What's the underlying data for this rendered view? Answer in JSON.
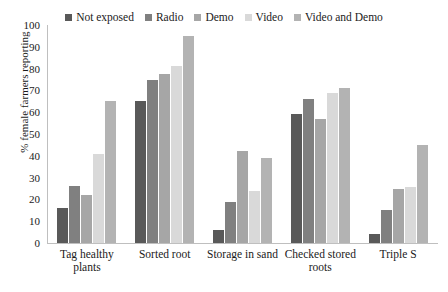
{
  "chart_data": {
    "type": "bar",
    "title": "",
    "xlabel": "",
    "ylabel": "% female farmers reporting",
    "ylim": [
      0,
      100
    ],
    "yticks": [
      0,
      10,
      20,
      30,
      40,
      50,
      60,
      70,
      80,
      90,
      100
    ],
    "grid": false,
    "legend_position": "top",
    "categories": [
      "Tag healthy plants",
      "Sorted root",
      "Storage in sand",
      "Checked stored roots",
      "Triple S"
    ],
    "series": [
      {
        "name": "Not exposed",
        "color": "#595959",
        "values": [
          16,
          65,
          6,
          59,
          4
        ]
      },
      {
        "name": "Radio",
        "color": "#808080",
        "values": [
          26,
          75,
          19,
          66,
          15
        ]
      },
      {
        "name": "Demo",
        "color": "#a6a6a6",
        "values": [
          22,
          77.5,
          42,
          57,
          25
        ]
      },
      {
        "name": "Video",
        "color": "#d9d9d9",
        "values": [
          41,
          81,
          24,
          69,
          25.5
        ]
      },
      {
        "name": "Video and Demo",
        "color": "#b3b3b3",
        "values": [
          65,
          95,
          39,
          71,
          45
        ]
      }
    ]
  },
  "axis": {
    "y_title": "% female farmers reporting"
  }
}
